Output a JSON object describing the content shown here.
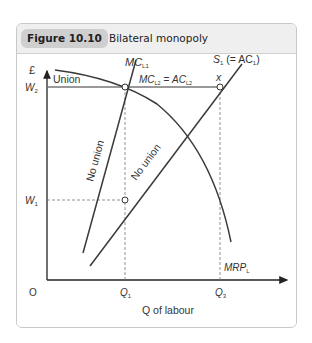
{
  "figure": {
    "number": "Figure 10.10",
    "title": "Bilateral monopoly"
  },
  "axes": {
    "y_label": "£",
    "x_label": "Q of labour",
    "origin": "O",
    "y_ticks": [
      {
        "main": "W",
        "sub": "2"
      },
      {
        "main": "W",
        "sub": "1"
      }
    ],
    "x_ticks": [
      {
        "main": "Q",
        "sub": "1"
      },
      {
        "main": "Q",
        "sub": "3"
      }
    ]
  },
  "curves": {
    "mc_l1": {
      "main": "MC",
      "sub": "L1"
    },
    "mc_l2_ac_l2": {
      "main1": "MC",
      "sub1": "L2",
      "eq": " = ",
      "main2": "AC",
      "sub2": "L2"
    },
    "supply": {
      "main": "S",
      "sub": "1",
      "rest": " (= AC",
      "sub2": "1",
      "close": ")"
    },
    "mrp": {
      "main": "MRP",
      "sub": "L"
    },
    "union_label": "Union",
    "no_union_mc": "No union",
    "no_union_s": "No union",
    "point_x": "x"
  },
  "colors": {
    "curve": "#3a3a3a",
    "guide": "#777777",
    "frame": "#c8c8c8",
    "badge": "#cfcfcf"
  }
}
